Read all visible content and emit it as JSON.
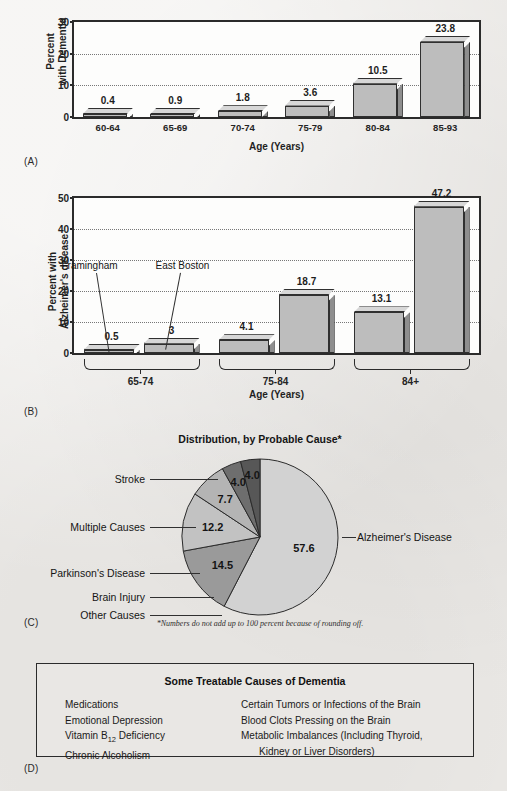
{
  "panels": {
    "a_letter": "(A)",
    "b_letter": "(B)",
    "c_letter": "(C)",
    "d_letter": "(D)"
  },
  "chart_data": [
    {
      "type": "bar",
      "panel": "(A)",
      "title": "",
      "xlabel": "Age (Years)",
      "ylabel": "Percent\nwith Dementia",
      "ylabel_line1": "Percent",
      "ylabel_line2": "with Dementia",
      "ylim": [
        0,
        30
      ],
      "yticks": [
        0,
        10,
        20,
        30
      ],
      "grid": true,
      "categories": [
        "60-64",
        "65-69",
        "70-74",
        "75-79",
        "80-84",
        "85-93"
      ],
      "values": [
        0.4,
        0.9,
        1.8,
        3.6,
        10.5,
        23.8
      ],
      "value_labels": [
        "0.4",
        "0.9",
        "1.8",
        "3.6",
        "10.5",
        "23.8"
      ]
    },
    {
      "type": "bar",
      "panel": "(B)",
      "title": "",
      "xlabel": "Age (Years)",
      "ylabel_line1": "Percent with",
      "ylabel_line2": "Alzheimer's disease",
      "ylim": [
        0,
        50
      ],
      "yticks": [
        0,
        10,
        20,
        30,
        40,
        50
      ],
      "grid": true,
      "categories": [
        "65-74",
        "75-84",
        "84+"
      ],
      "series": [
        {
          "name": "Framingham",
          "values": [
            0.5,
            4.1,
            13.1
          ],
          "value_labels": [
            "0.5",
            "4.1",
            "13.1"
          ]
        },
        {
          "name": "East Boston",
          "values": [
            3,
            18.7,
            47.2
          ],
          "value_labels": [
            "3",
            "18.7",
            "47.2"
          ]
        }
      ],
      "annotations": [
        "Framingham",
        "East Boston"
      ]
    },
    {
      "type": "pie",
      "panel": "(C)",
      "title": "Distribution, by Probable Cause*",
      "footnote": "*Numbers do not add up to 100 percent because of rounding off.",
      "labels": [
        "Alzheimer's Disease",
        "Stroke",
        "Multiple Causes",
        "Parkinson's Disease",
        "Brain Injury",
        "Other Causes"
      ],
      "values": [
        57.6,
        14.5,
        12.2,
        7.7,
        4.0,
        4.0
      ],
      "value_labels": [
        "57.6",
        "14.5",
        "12.2",
        "7.7",
        "4.0",
        "4.0"
      ],
      "colors": [
        "#d2d2d2",
        "#9a9a9a",
        "#c2c2c2",
        "#b4b4b4",
        "#6e6e6e",
        "#575757"
      ]
    }
  ],
  "treatable_box": {
    "title": "Some Treatable Causes of Dementia",
    "left_items": [
      "Medications",
      "Emotional Depression",
      "Vitamin B12 Deficiency",
      "Chronic Alcoholism"
    ],
    "left_items_html": [
      "Medications",
      "Emotional Depression",
      "Vitamin B<sub>12</sub> Deficiency",
      "Chronic Alcoholism"
    ],
    "right_items": [
      "Certain Tumors or Infections of the Brain",
      "Blood Clots Pressing on the Brain",
      "Metabolic Imbalances (Including Thyroid,",
      "Kidney or Liver Disorders)"
    ]
  }
}
